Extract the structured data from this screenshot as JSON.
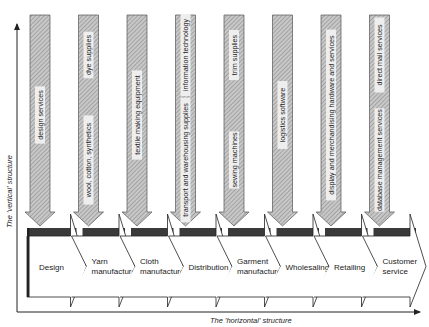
{
  "axes": {
    "vertical_label": "The 'vertical' structure",
    "horizontal_label": "The 'horizontal' structure"
  },
  "colors": {
    "bar_fill": "#bdbdbd",
    "hatch": "#8a8a8a",
    "dark_band": "#3a3a3a",
    "line": "#222222"
  },
  "stages": [
    {
      "lines": [
        "Design"
      ],
      "inputs": [
        "design services"
      ]
    },
    {
      "lines": [
        "Yarn",
        "manufacture"
      ],
      "inputs": [
        "wool, cotton, synthetics",
        "dye supplies"
      ]
    },
    {
      "lines": [
        "Cloth",
        "manufacture"
      ],
      "inputs": [
        "textile making equipment"
      ]
    },
    {
      "lines": [
        "Distribution"
      ],
      "inputs": [
        "transport and warehousing supplies",
        "information technology"
      ]
    },
    {
      "lines": [
        "Garment",
        "manufacture"
      ],
      "inputs": [
        "sewing machines",
        "trim supplies"
      ]
    },
    {
      "lines": [
        "Wholesaling"
      ],
      "inputs": [
        "logistics software"
      ]
    },
    {
      "lines": [
        "Retailing"
      ],
      "inputs": [
        "display and merchandising hardware and services"
      ]
    },
    {
      "lines": [
        "Customer",
        "service"
      ],
      "inputs": [
        "database management services",
        "direct mail services"
      ]
    }
  ]
}
